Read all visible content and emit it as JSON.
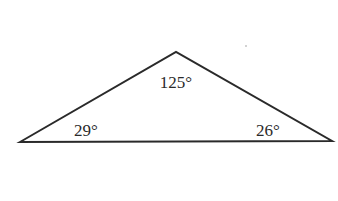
{
  "diagram": {
    "type": "triangle",
    "vertices": {
      "left": [
        20,
        142
      ],
      "apex": [
        176,
        52
      ],
      "right": [
        332,
        141
      ]
    },
    "angles": {
      "apex": "125°",
      "left": "29°",
      "right": "26°"
    },
    "stroke_color": "#2a2a2a",
    "background": "#ffffff"
  }
}
